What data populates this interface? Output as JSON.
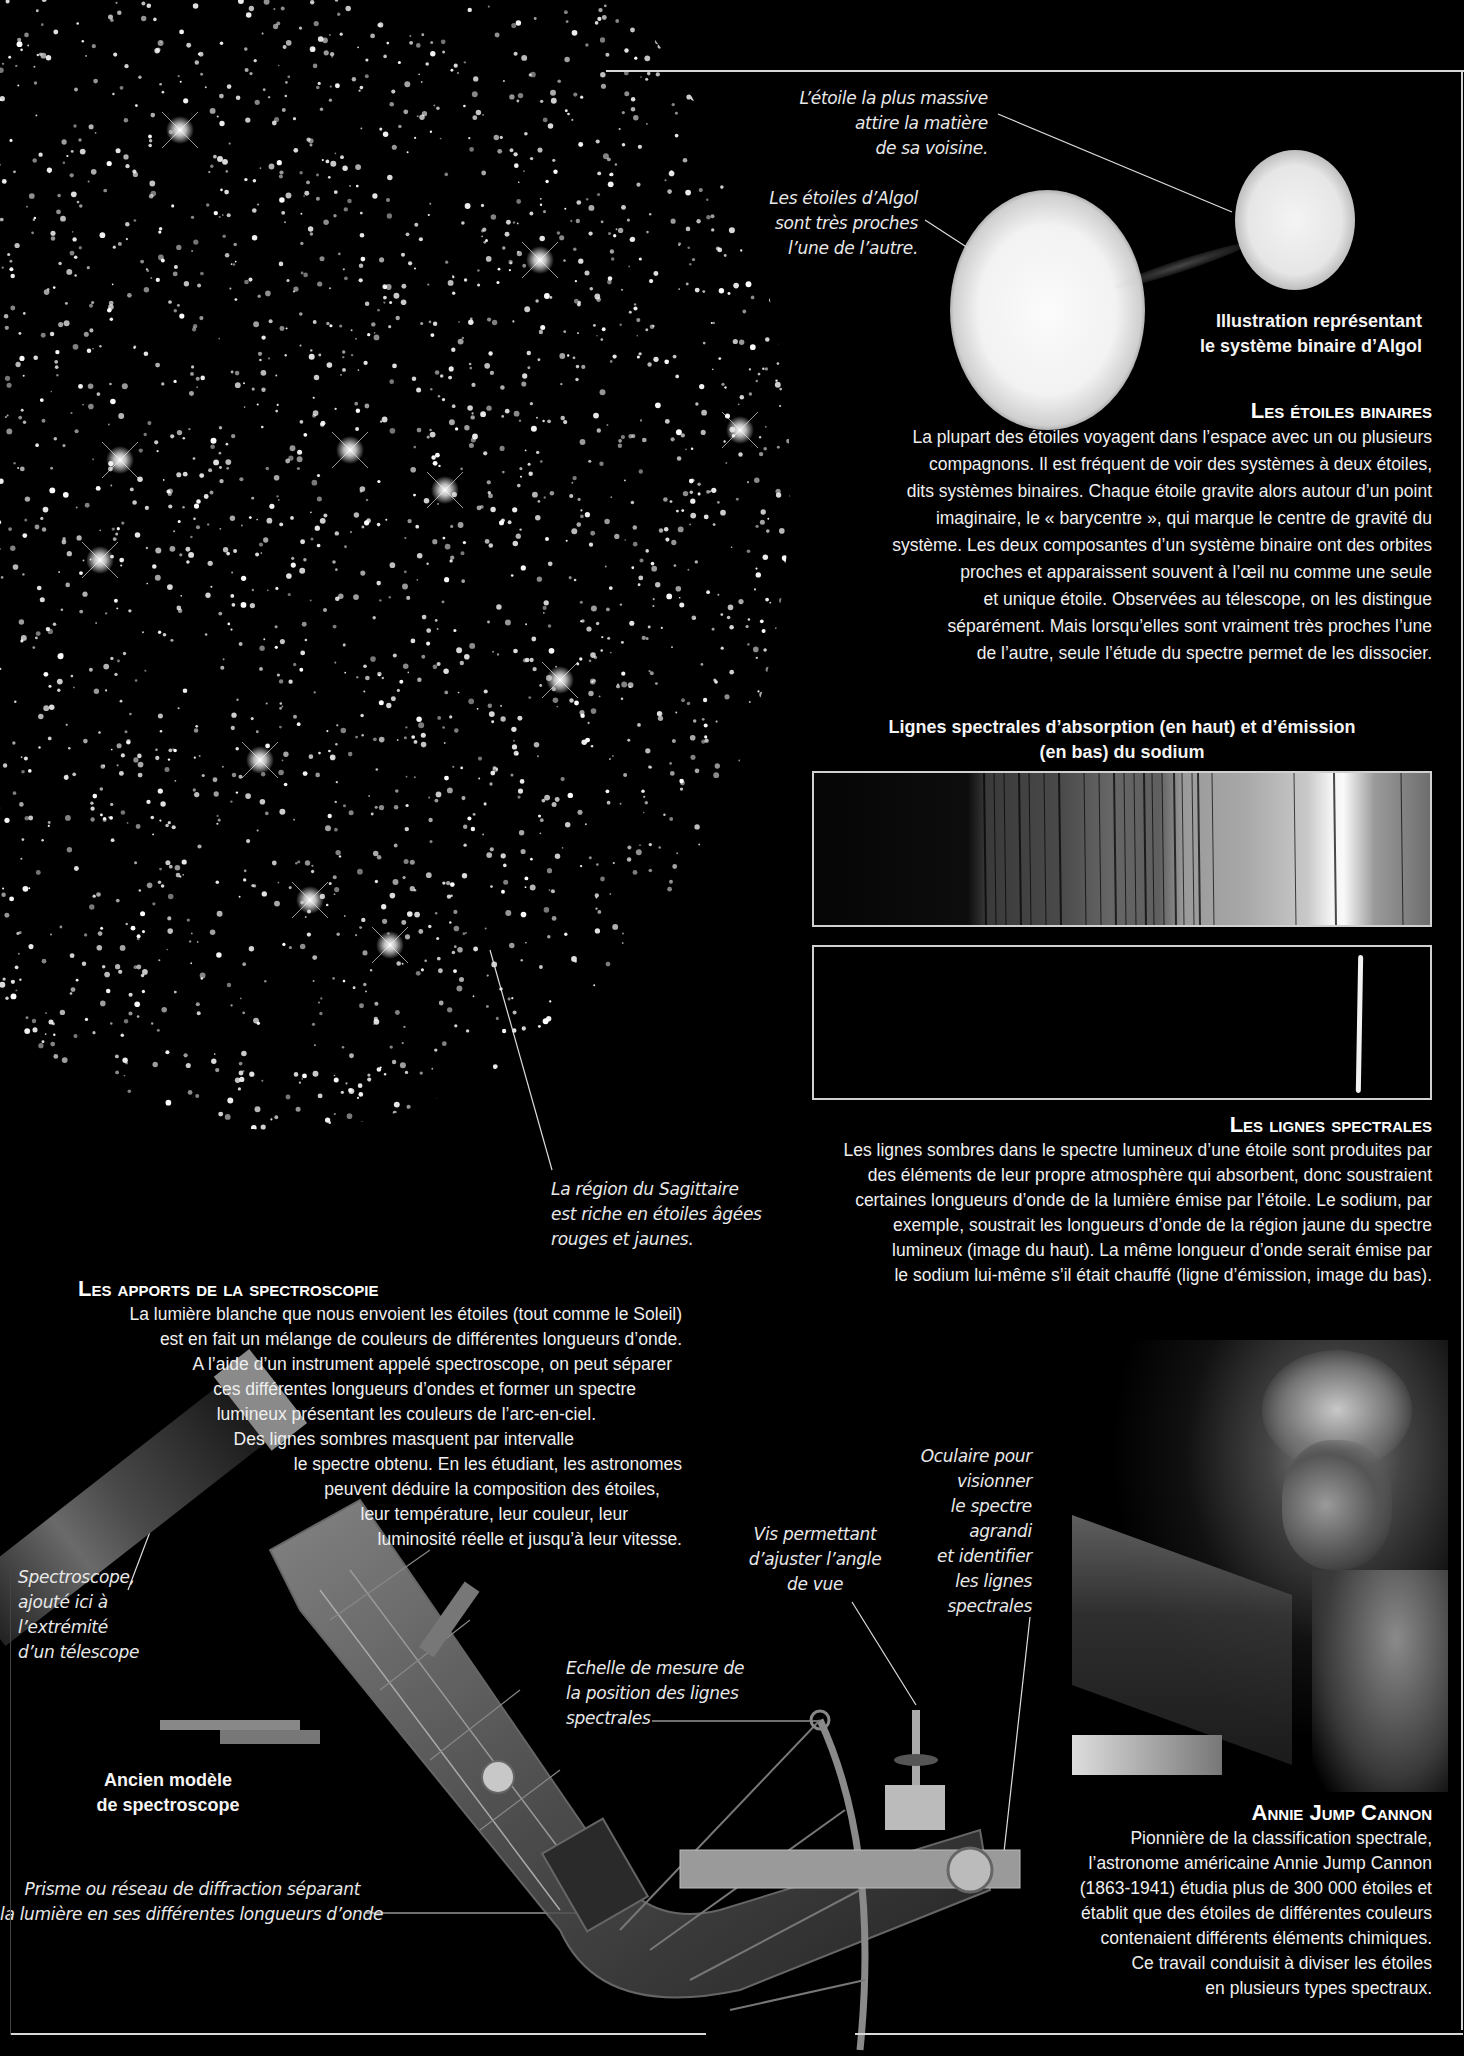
{
  "page": {
    "background": "#000000",
    "rule_color": "#d8d8d8"
  },
  "cluster": {
    "callout": {
      "lines": [
        "La région du Sagittaire",
        "est riche en étoiles âgées",
        "rouges et jaunes."
      ]
    }
  },
  "algol": {
    "callout_massive": {
      "lines": [
        "L’étoile la plus massive",
        "attire la matière",
        "de sa voisine."
      ]
    },
    "callout_close": {
      "lines": [
        "Les étoiles d’Algol",
        "sont très proches",
        "l’une de l’autre."
      ]
    },
    "caption": {
      "lines": [
        "Illustration représentant",
        "le système binaire d’Algol"
      ]
    }
  },
  "binary_section": {
    "heading": "Les étoiles binaires",
    "lines": [
      "La plupart des étoiles voyagent dans l’espace avec un ou plusieurs",
      "compagnons. Il est fréquent de voir des systèmes à deux étoiles,",
      "dits systèmes binaires. Chaque étoile gravite alors autour d’un point",
      "imaginaire, le « barycentre », qui marque le centre de gravité du",
      "système. Les deux composantes d’un système binaire ont des orbites",
      "proches et apparaissent souvent à l’œil nu comme une seule",
      "et unique étoile. Observées au télescope, on les distingue",
      "séparément. Mais lorsqu’elles sont vraiment très proches l’une",
      "de l’autre, seule l’étude du spectre permet de les dissocier."
    ]
  },
  "spectra": {
    "title_lines": [
      "Lignes spectrales d’absorption (en haut) et d’émission",
      "(en bas) du sodium"
    ],
    "absorption_label": "absorption-spectrum",
    "emission_label": "emission-spectrum"
  },
  "spectral_section": {
    "heading": "Les lignes spectrales",
    "lines": [
      "Les lignes sombres dans le spectre lumineux d’une étoile sont produites par",
      "des éléments de leur propre atmosphère qui absorbent, donc soustraient",
      "certaines longueurs d’onde de la lumière émise par l’étoile. Le sodium, par",
      "exemple, soustrait les longueurs d’onde de la région jaune du spectre",
      "lumineux (image du haut). La même longueur d’onde serait émise par",
      "le sodium lui-même s’il était chauffé (ligne d’émission, image du bas)."
    ]
  },
  "spectroscopy_section": {
    "heading": "Les apports de la spectroscopie",
    "lines": [
      "La lumière blanche que nous envoient les étoiles (tout comme le Soleil)",
      "est en fait un mélange de couleurs de différentes longueurs d’onde.",
      "A l’aide d’un instrument appelé spectroscope, on peut séparer",
      "ces différentes longueurs d’ondes et former un spectre",
      "lumineux présentant les couleurs de l’arc-en-ciel.",
      "Des lignes sombres masquent par intervalle",
      "le spectre obtenu. En les étudiant, les astronomes",
      "peuvent déduire la composition des étoiles,",
      "leur température, leur couleur, leur",
      "luminosité réelle et jusqu’à leur vitesse."
    ]
  },
  "spectroscope": {
    "callout_telescope": {
      "lines": [
        "Spectroscope,",
        "ajouté ici à",
        "l’extrémité",
        "d’un télescope"
      ]
    },
    "caption": {
      "lines": [
        "Ancien modèle",
        "de spectroscope"
      ]
    },
    "callout_prism": {
      "lines": [
        "Prisme ou réseau de diffraction séparant",
        "la lumière en ses différentes longueurs d’onde"
      ]
    },
    "callout_scale": {
      "lines": [
        "Echelle de mesure de",
        "la position des lignes",
        "spectrales"
      ]
    },
    "callout_screw": {
      "lines": [
        "Vis permettant",
        "d’ajuster l’angle",
        "de vue"
      ]
    },
    "callout_eyepiece": {
      "lines": [
        "Oculaire pour",
        "visionner",
        "le spectre",
        "agrandi",
        "et identifier",
        "les lignes",
        "spectrales"
      ]
    }
  },
  "cannon_section": {
    "heading": "Annie Jump Cannon",
    "lines": [
      "Pionnière de la classification spectrale,",
      "l’astronome américaine Annie Jump Cannon",
      "(1863-1941) étudia plus de 300 000 étoiles et",
      "établit que des étoiles de différentes couleurs",
      "contenaient différents éléments chimiques.",
      "Ce travail conduisit à diviser les étoiles",
      "en plusieurs types spectraux."
    ]
  }
}
